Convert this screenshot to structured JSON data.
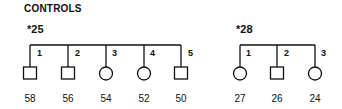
{
  "title": "CONTROLS",
  "families": [
    {
      "label": "*25",
      "members": [
        {
          "number": "1",
          "sex": "male",
          "age": "58"
        },
        {
          "number": "2",
          "sex": "male",
          "age": "56"
        },
        {
          "number": "3",
          "sex": "female",
          "age": "54"
        },
        {
          "number": "4",
          "sex": "female",
          "age": "52"
        },
        {
          "number": "5",
          "sex": "male",
          "age": "50"
        }
      ]
    },
    {
      "label": "*28",
      "members": [
        {
          "number": "1",
          "sex": "female",
          "age": "27"
        },
        {
          "number": "2",
          "sex": "male",
          "age": "26"
        },
        {
          "number": "3",
          "sex": "female",
          "age": "24"
        }
      ]
    }
  ],
  "colors": {
    "line": "#111111",
    "background": "#ffffff"
  }
}
